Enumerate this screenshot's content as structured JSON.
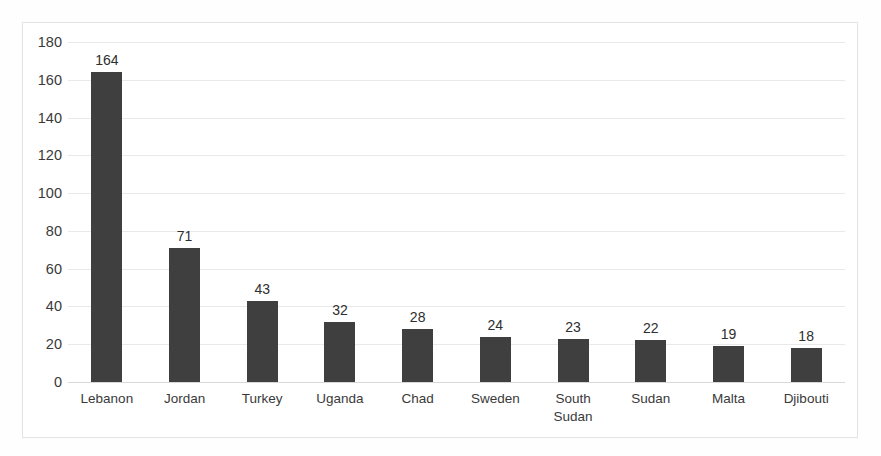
{
  "chart_data": {
    "type": "bar",
    "title": "",
    "subtitle": "",
    "xlabel": "",
    "ylabel": "",
    "categories": [
      "Lebanon",
      "Jordan",
      "Turkey",
      "Uganda",
      "Chad",
      "Sweden",
      "South\nSudan",
      "Sudan",
      "Malta",
      "Djibouti"
    ],
    "values": [
      164,
      71,
      43,
      32,
      28,
      24,
      23,
      22,
      19,
      18
    ],
    "data_labels": [
      "164",
      "71",
      "43",
      "32",
      "28",
      "24",
      "23",
      "22",
      "19",
      "18"
    ],
    "ylim": [
      0,
      180
    ],
    "ytick_step": 20,
    "ytick_labels": [
      "180",
      "160",
      "140",
      "120",
      "100",
      "80",
      "60",
      "40",
      "20",
      "0"
    ],
    "ytick_values": [
      180,
      160,
      140,
      120,
      100,
      80,
      60,
      40,
      20,
      0
    ],
    "grid": true,
    "grid_axis": "y",
    "legend": false,
    "legend_position": "none",
    "series": [
      {
        "name": "Count",
        "values": [
          164,
          71,
          43,
          32,
          28,
          24,
          23,
          22,
          19,
          18
        ]
      }
    ]
  },
  "style": {
    "bar_color": "#3f3f3f",
    "grid_color": "#e9e9e9",
    "baseline_color": "#d8d8d8",
    "frame_color": "#e3e3e3",
    "text_color": "#3a3a3a",
    "value_label_color": "#2e2e2e",
    "background": "#ffffff"
  }
}
